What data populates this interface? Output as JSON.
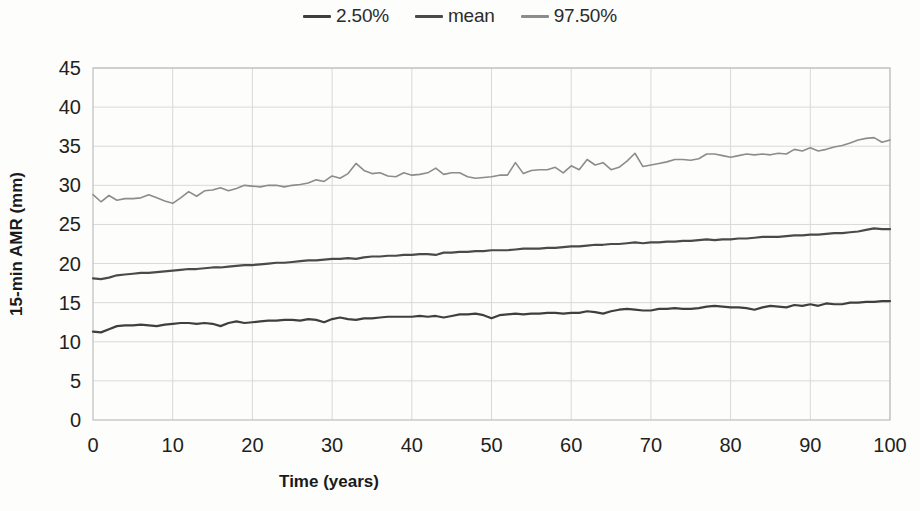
{
  "chart_data": {
    "type": "line",
    "title": "",
    "xlabel": "Time (years)",
    "ylabel": "15-min AMR (mm)",
    "xlim": [
      0,
      100
    ],
    "ylim": [
      0,
      45
    ],
    "xticks": [
      0,
      10,
      20,
      30,
      40,
      50,
      60,
      70,
      80,
      90,
      100
    ],
    "yticks": [
      0,
      5,
      10,
      15,
      20,
      25,
      30,
      35,
      40,
      45
    ],
    "grid": true,
    "legend_position": "top-center",
    "x": [
      0,
      1,
      2,
      3,
      4,
      5,
      6,
      7,
      8,
      9,
      10,
      11,
      12,
      13,
      14,
      15,
      16,
      17,
      18,
      19,
      20,
      21,
      22,
      23,
      24,
      25,
      26,
      27,
      28,
      29,
      30,
      31,
      32,
      33,
      34,
      35,
      36,
      37,
      38,
      39,
      40,
      41,
      42,
      43,
      44,
      45,
      46,
      47,
      48,
      49,
      50,
      51,
      52,
      53,
      54,
      55,
      56,
      57,
      58,
      59,
      60,
      61,
      62,
      63,
      64,
      65,
      66,
      67,
      68,
      69,
      70,
      71,
      72,
      73,
      74,
      75,
      76,
      77,
      78,
      79,
      80,
      81,
      82,
      83,
      84,
      85,
      86,
      87,
      88,
      89,
      90,
      91,
      92,
      93,
      94,
      95,
      96,
      97,
      98,
      99,
      100
    ],
    "series": [
      {
        "name": "2.50%",
        "color": "#3f3f3f",
        "values": [
          11.3,
          11.2,
          11.6,
          12.0,
          12.1,
          12.1,
          12.2,
          12.1,
          12.0,
          12.2,
          12.3,
          12.4,
          12.4,
          12.3,
          12.4,
          12.3,
          12.0,
          12.4,
          12.6,
          12.4,
          12.5,
          12.6,
          12.7,
          12.7,
          12.8,
          12.8,
          12.7,
          12.9,
          12.8,
          12.5,
          12.9,
          13.1,
          12.9,
          12.8,
          13.0,
          13.0,
          13.1,
          13.2,
          13.2,
          13.2,
          13.2,
          13.3,
          13.2,
          13.3,
          13.1,
          13.3,
          13.5,
          13.5,
          13.6,
          13.4,
          13.0,
          13.4,
          13.5,
          13.6,
          13.5,
          13.6,
          13.6,
          13.7,
          13.7,
          13.6,
          13.7,
          13.7,
          13.9,
          13.8,
          13.6,
          13.9,
          14.1,
          14.2,
          14.1,
          14.0,
          14.0,
          14.2,
          14.2,
          14.3,
          14.2,
          14.2,
          14.3,
          14.5,
          14.6,
          14.5,
          14.4,
          14.4,
          14.3,
          14.1,
          14.4,
          14.6,
          14.5,
          14.4,
          14.7,
          14.6,
          14.8,
          14.6,
          14.9,
          14.8,
          14.8,
          15.0,
          15.0,
          15.1,
          15.1,
          15.2,
          15.2
        ]
      },
      {
        "name": "mean",
        "color": "#4a4a4a",
        "values": [
          18.1,
          18.0,
          18.2,
          18.5,
          18.6,
          18.7,
          18.8,
          18.8,
          18.9,
          19.0,
          19.1,
          19.2,
          19.3,
          19.3,
          19.4,
          19.5,
          19.5,
          19.6,
          19.7,
          19.8,
          19.8,
          19.9,
          20.0,
          20.1,
          20.1,
          20.2,
          20.3,
          20.4,
          20.4,
          20.5,
          20.6,
          20.6,
          20.7,
          20.6,
          20.8,
          20.9,
          20.9,
          21.0,
          21.0,
          21.1,
          21.1,
          21.2,
          21.2,
          21.1,
          21.4,
          21.4,
          21.5,
          21.5,
          21.6,
          21.6,
          21.7,
          21.7,
          21.7,
          21.8,
          21.9,
          21.9,
          21.9,
          22.0,
          22.0,
          22.1,
          22.2,
          22.2,
          22.3,
          22.4,
          22.4,
          22.5,
          22.5,
          22.6,
          22.7,
          22.6,
          22.7,
          22.7,
          22.8,
          22.8,
          22.9,
          22.9,
          23.0,
          23.1,
          23.0,
          23.1,
          23.1,
          23.2,
          23.2,
          23.3,
          23.4,
          23.4,
          23.4,
          23.5,
          23.6,
          23.6,
          23.7,
          23.7,
          23.8,
          23.9,
          23.9,
          24.0,
          24.1,
          24.3,
          24.5,
          24.4,
          24.4
        ]
      },
      {
        "name": "97.50%",
        "color": "#8c8c8c",
        "values": [
          28.8,
          27.9,
          28.7,
          28.1,
          28.3,
          28.3,
          28.4,
          28.8,
          28.4,
          28.0,
          27.7,
          28.4,
          29.2,
          28.6,
          29.3,
          29.4,
          29.7,
          29.3,
          29.6,
          30.0,
          29.9,
          29.8,
          30.0,
          30.0,
          29.8,
          30.0,
          30.1,
          30.3,
          30.7,
          30.5,
          31.2,
          30.9,
          31.5,
          32.8,
          31.9,
          31.5,
          31.6,
          31.2,
          31.1,
          31.6,
          31.3,
          31.4,
          31.6,
          32.2,
          31.4,
          31.6,
          31.6,
          31.1,
          30.9,
          31.0,
          31.1,
          31.3,
          31.3,
          32.9,
          31.5,
          31.9,
          32.0,
          32.0,
          32.3,
          31.6,
          32.5,
          32.0,
          33.3,
          32.6,
          32.9,
          32.0,
          32.3,
          33.1,
          34.1,
          32.4,
          32.6,
          32.8,
          33.0,
          33.3,
          33.3,
          33.2,
          33.4,
          34.0,
          34.0,
          33.8,
          33.6,
          33.8,
          34.0,
          33.9,
          34.0,
          33.9,
          34.1,
          34.0,
          34.6,
          34.4,
          34.8,
          34.4,
          34.6,
          34.9,
          35.1,
          35.4,
          35.8,
          36.0,
          36.1,
          35.5,
          35.8
        ]
      }
    ]
  },
  "legend": {
    "entries": [
      {
        "label": "2.50%",
        "color": "#3f3f3f"
      },
      {
        "label": "mean",
        "color": "#4a4a4a"
      },
      {
        "label": "97.50%",
        "color": "#8c8c8c"
      }
    ]
  },
  "axes": {
    "x_title": "Time (years)",
    "y_title": "15-min AMR (mm)",
    "x_tick_labels": [
      "0",
      "10",
      "20",
      "30",
      "40",
      "50",
      "60",
      "70",
      "80",
      "90",
      "100"
    ],
    "y_tick_labels": [
      "0",
      "5",
      "10",
      "15",
      "20",
      "25",
      "30",
      "35",
      "40",
      "45"
    ]
  }
}
